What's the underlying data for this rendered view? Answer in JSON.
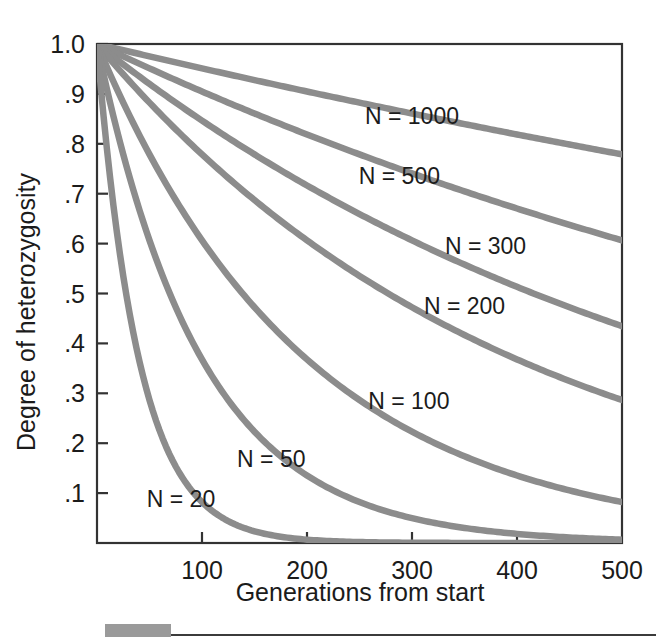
{
  "chart_data": {
    "type": "line",
    "title": "",
    "xlabel": "Generations from start",
    "ylabel": "Degree of heterozygosity",
    "xlim": [
      0,
      500
    ],
    "ylim": [
      0,
      1.0
    ],
    "grid": false,
    "legend_position": "inline-labels",
    "xticks": [
      100,
      200,
      300,
      400,
      500
    ],
    "xtick_labels": [
      "100",
      "200",
      "300",
      "400",
      "500"
    ],
    "yticks": [
      0.1,
      0.2,
      0.3,
      0.4,
      0.5,
      0.6,
      0.7,
      0.8,
      0.9,
      1.0
    ],
    "ytick_labels": [
      ".1",
      ".2",
      ".3",
      ".4",
      ".5",
      ".6",
      ".7",
      ".8",
      ".9",
      "1.0"
    ],
    "curve_color": "#8c8c8c",
    "axis_color": "#333333",
    "x": [
      0,
      25,
      50,
      75,
      100,
      125,
      150,
      175,
      200,
      225,
      250,
      275,
      300,
      325,
      350,
      375,
      400,
      425,
      450,
      475,
      500
    ],
    "series": [
      {
        "name": "N = 1000",
        "N": 1000,
        "label": "N = 1000",
        "label_x": 300,
        "label_y": 0.855,
        "values": [
          1.0,
          0.9876,
          0.9753,
          0.9632,
          0.9512,
          0.9394,
          0.9277,
          0.9162,
          0.9048,
          0.8936,
          0.8825,
          0.8715,
          0.8607,
          0.85,
          0.8395,
          0.829,
          0.8187,
          0.8086,
          0.7985,
          0.7886,
          0.7788
        ]
      },
      {
        "name": "N = 500",
        "N": 500,
        "label": "N = 500",
        "label_x": 288,
        "label_y": 0.735,
        "values": [
          1.0,
          0.9753,
          0.9512,
          0.9277,
          0.9048,
          0.8825,
          0.8607,
          0.8395,
          0.8187,
          0.7985,
          0.7788,
          0.7595,
          0.7408,
          0.7225,
          0.7047,
          0.6873,
          0.6703,
          0.6538,
          0.6376,
          0.6219,
          0.6065
        ]
      },
      {
        "name": "N = 300",
        "N": 300,
        "label": "N = 300",
        "label_x": 370,
        "label_y": 0.595,
        "values": [
          1.0,
          0.9592,
          0.92,
          0.8825,
          0.8465,
          0.8119,
          0.7788,
          0.747,
          0.7165,
          0.6873,
          0.6592,
          0.6323,
          0.6065,
          0.5817,
          0.558,
          0.5352,
          0.5134,
          0.4924,
          0.4724,
          0.4531,
          0.4346
        ]
      },
      {
        "name": "N = 200",
        "N": 200,
        "label": "N = 200",
        "label_x": 350,
        "label_y": 0.475,
        "values": [
          1.0,
          0.9394,
          0.8825,
          0.829,
          0.7788,
          0.7316,
          0.6873,
          0.6456,
          0.6065,
          0.5698,
          0.5353,
          0.5029,
          0.4724,
          0.4437,
          0.4169,
          0.3916,
          0.3679,
          0.3456,
          0.3247,
          0.305,
          0.2865
        ]
      },
      {
        "name": "N = 100",
        "N": 100,
        "label": "N = 100",
        "label_x": 297,
        "label_y": 0.285,
        "values": [
          1.0,
          0.8825,
          0.7788,
          0.6873,
          0.6065,
          0.5353,
          0.4724,
          0.4169,
          0.3679,
          0.3247,
          0.2865,
          0.2528,
          0.2231,
          0.1969,
          0.1738,
          0.1533,
          0.1353,
          0.1194,
          0.1054,
          0.093,
          0.0821
        ]
      },
      {
        "name": "N = 50",
        "N": 50,
        "label": "N = 50",
        "label_x": 166,
        "label_y": 0.168,
        "values": [
          1.0,
          0.7788,
          0.6065,
          0.4724,
          0.3679,
          0.2865,
          0.2231,
          0.1738,
          0.1353,
          0.1054,
          0.0821,
          0.0639,
          0.0498,
          0.0388,
          0.0302,
          0.0235,
          0.0183,
          0.0143,
          0.0111,
          0.0087,
          0.0067
        ]
      },
      {
        "name": "N = 20",
        "N": 20,
        "label": "N = 20",
        "label_x": 80,
        "label_y": 0.088,
        "values": [
          1.0,
          0.5353,
          0.2865,
          0.1533,
          0.0821,
          0.0439,
          0.0235,
          0.0126,
          0.0067,
          0.0036,
          0.0019,
          0.001,
          0.0006,
          0.0003,
          0.0002,
          0.0001,
          0.0001,
          0.0,
          0.0,
          0.0,
          0.0
        ]
      }
    ]
  },
  "footer": {
    "bar_color": "#9a9a9a"
  }
}
